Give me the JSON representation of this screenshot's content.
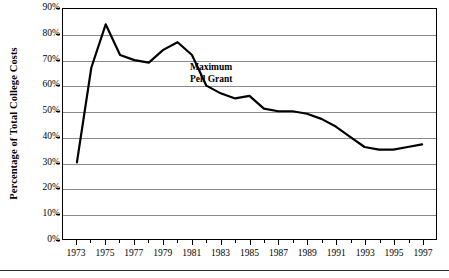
{
  "chart_data": {
    "type": "line",
    "title": "",
    "xlabel": "",
    "ylabel": "Percentage of Total College Costs",
    "ylim": [
      0,
      90
    ],
    "xlim": [
      1973,
      1997
    ],
    "grid": true,
    "legend": "none",
    "annotations": [
      {
        "text_line1": "Maximum",
        "text_line2": "Pell Grant",
        "x": 1981,
        "y": 65
      }
    ],
    "ytick_labels": [
      "90%",
      "80%",
      "70%",
      "60%",
      "50%",
      "40%",
      "30%",
      "20%",
      "10%",
      "0%"
    ],
    "ytick_values": [
      90,
      80,
      70,
      60,
      50,
      40,
      30,
      20,
      10,
      0
    ],
    "xtick_labels": [
      "1973",
      "1975",
      "1977",
      "1979",
      "1981",
      "1983",
      "1985",
      "1987",
      "1989",
      "1991",
      "1993",
      "1995",
      "1997"
    ],
    "xtick_values": [
      1973,
      1975,
      1977,
      1979,
      1981,
      1983,
      1985,
      1987,
      1989,
      1991,
      1993,
      1995,
      1997
    ],
    "series": [
      {
        "name": "Maximum Pell Grant",
        "color": "#000000",
        "x": [
          1973,
          1974,
          1975,
          1976,
          1977,
          1978,
          1979,
          1980,
          1981,
          1982,
          1983,
          1984,
          1985,
          1986,
          1987,
          1988,
          1989,
          1990,
          1991,
          1992,
          1993,
          1994,
          1995,
          1996,
          1997
        ],
        "values": [
          30,
          67,
          84,
          72,
          70,
          69,
          74,
          77,
          72,
          60,
          57,
          55,
          56,
          51,
          50,
          50,
          49,
          47,
          44,
          40,
          36,
          35,
          35,
          36,
          37
        ]
      }
    ]
  },
  "axis": {
    "y_title": "Percentage of Total College Costs"
  }
}
